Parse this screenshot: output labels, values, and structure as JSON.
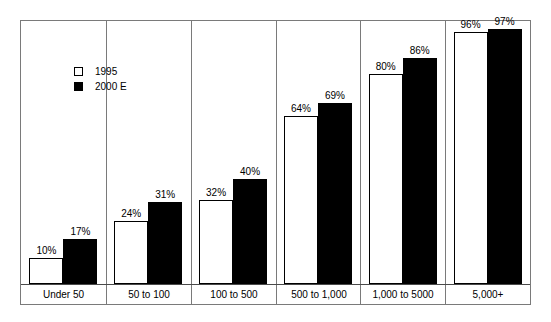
{
  "chart_data": {
    "type": "bar",
    "title": "",
    "subtitle": "",
    "xlabel": "",
    "ylabel": "",
    "ylim": [
      0,
      100
    ],
    "grid": false,
    "legend_position": "upper-left-inside",
    "categories": [
      "Under 50",
      "50 to 100",
      "100 to 500",
      "500 to 1,000",
      "1,000 to 5000",
      "5,000+"
    ],
    "series": [
      {
        "name": "1995",
        "color": "#ffffff",
        "values": [
          10,
          24,
          32,
          64,
          80,
          96
        ],
        "labels": [
          "10%",
          "24%",
          "32%",
          "64%",
          "80%",
          "96%"
        ]
      },
      {
        "name": "2000 E",
        "color": "#000000",
        "values": [
          17,
          31,
          40,
          69,
          86,
          97
        ],
        "labels": [
          "17%",
          "31%",
          "40%",
          "69%",
          "86%",
          "97%"
        ]
      }
    ]
  },
  "legend": {
    "items": [
      {
        "label": "1995",
        "swatch": "open-square"
      },
      {
        "label": "2000 E",
        "swatch": "filled-square"
      }
    ]
  },
  "colors": {
    "frame": "#7a7a7a",
    "axis": "#4a4a4a",
    "bar_1995": "#ffffff",
    "bar_2000": "#000000",
    "background": "#ffffff",
    "text": "#000000"
  }
}
